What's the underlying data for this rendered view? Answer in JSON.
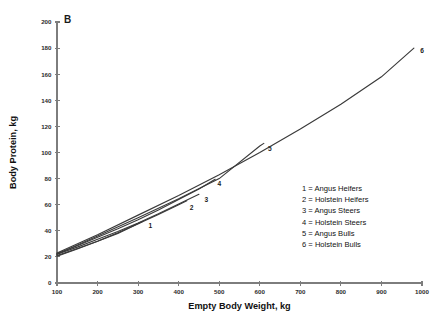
{
  "chart_data": {
    "type": "line",
    "title": "",
    "panel_label": "B",
    "xlabel": "Empty Body Weight, kg",
    "ylabel": "Body Protein, kg",
    "xlim": [
      100,
      1000
    ],
    "ylim": [
      0,
      200
    ],
    "xticks": [
      100,
      200,
      300,
      400,
      500,
      600,
      700,
      800,
      900,
      1000
    ],
    "yticks": [
      0,
      20,
      40,
      60,
      80,
      100,
      120,
      140,
      160,
      180,
      200
    ],
    "xtick_labels": [
      "100",
      "200",
      "300",
      "400",
      "500",
      "600",
      "700",
      "800",
      "900",
      "1000"
    ],
    "ytick_labels": [
      "0",
      "20",
      "40",
      "60",
      "80",
      "100",
      "120",
      "140",
      "160",
      "180",
      "200"
    ],
    "grid": false,
    "legend_position": "center-right",
    "legend_entries": [
      "1 = Angus Heifers",
      "2 = Holstein Heifers",
      "3 = Angus Steers",
      "4 = Holstein Steers",
      "5 = Angus Bulls",
      "6 = Holstein Bulls"
    ],
    "series": [
      {
        "name": "Angus Heifers",
        "marker_label": "1",
        "label_point": [
          330,
          42
        ],
        "x": [
          100,
          150,
          200,
          250,
          300,
          310
        ],
        "values": [
          21.0,
          26.5,
          32.0,
          38.0,
          45.5,
          47.0
        ]
      },
      {
        "name": "Holstein Heifers",
        "marker_label": "2",
        "label_point": [
          432,
          56
        ],
        "x": [
          100,
          150,
          200,
          250,
          300,
          350,
          400,
          420
        ],
        "values": [
          20.5,
          26.0,
          32.0,
          38.5,
          45.5,
          52.5,
          60.0,
          63.0
        ]
      },
      {
        "name": "Angus Steers",
        "marker_label": "3",
        "label_point": [
          468,
          62
        ],
        "x": [
          100,
          150,
          200,
          250,
          300,
          350,
          400,
          450
        ],
        "values": [
          22.0,
          27.5,
          33.5,
          39.5,
          46.0,
          53.0,
          60.5,
          68.0
        ]
      },
      {
        "name": "Holstein Steers",
        "marker_label": "4",
        "label_point": [
          500,
          74
        ],
        "x": [
          100,
          150,
          200,
          250,
          300,
          350,
          400,
          450,
          490
        ],
        "values": [
          22.5,
          28.5,
          35.0,
          41.5,
          48.5,
          56.0,
          64.0,
          72.0,
          79.5
        ]
      },
      {
        "name": "Angus Bulls",
        "marker_label": "5",
        "label_point": [
          625,
          101
        ],
        "x": [
          100,
          200,
          300,
          400,
          500,
          600,
          610
        ],
        "values": [
          22.0,
          36.0,
          50.0,
          64.5,
          80.0,
          105.0,
          107.0
        ]
      },
      {
        "name": "Holstein Bulls",
        "marker_label": "6",
        "label_point": [
          1000,
          176
        ],
        "x": [
          100,
          200,
          300,
          400,
          500,
          600,
          700,
          800,
          900,
          980
        ],
        "values": [
          23.0,
          37.0,
          52.0,
          67.0,
          83.0,
          100.0,
          118.0,
          137.0,
          158.0,
          180.0
        ]
      }
    ]
  }
}
